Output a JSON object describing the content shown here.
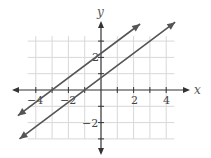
{
  "chart_data": {
    "type": "line",
    "title": "",
    "xlabel": "x",
    "ylabel": "y",
    "xlim": [
      -5,
      5
    ],
    "ylim": [
      -3.5,
      4.5
    ],
    "grid": true,
    "x_ticks": [
      -4,
      -2,
      2,
      4
    ],
    "y_ticks": [
      -2,
      2
    ],
    "x_tick_labels": [
      "−4",
      "−2",
      "2",
      "4"
    ],
    "y_tick_labels": [
      "−2",
      "2"
    ],
    "series": [
      {
        "name": "line-upper",
        "equation": "y = 0.75x + 2.25",
        "slope": 0.75,
        "intercept": 2.25,
        "x": [
          -5.1,
          2.4
        ],
        "y": [
          -1.575,
          4.05
        ]
      },
      {
        "name": "line-lower",
        "equation": "y = 0.75x + 0.75",
        "slope": 0.75,
        "intercept": 0.75,
        "x": [
          -5.0,
          4.55
        ],
        "y": [
          -3.0,
          4.16
        ]
      }
    ],
    "colors": {
      "lines": "#555555",
      "grid": "#d8d8d8",
      "axes": "#333333"
    }
  }
}
